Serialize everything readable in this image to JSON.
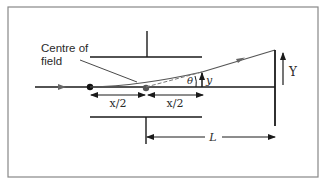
{
  "diagram": {
    "labels": {
      "centre_of_field_line1": "Centre of",
      "centre_of_field_line2": "field",
      "half_length_left": "x/2",
      "half_length_right": "x/2",
      "theta": "θ",
      "small_y": "y",
      "big_y": "Y",
      "distance_L": "L"
    },
    "elements": {
      "frame": "border",
      "top_plate": "deflection-plate",
      "bottom_plate": "deflection-plate",
      "screen": "screen",
      "beam_path": "curved-trajectory",
      "straight_extension": "dashed-extrapolation",
      "axis": "horizontal-axis"
    },
    "colors": {
      "line": "#2a2a2a",
      "beam": "#555555",
      "frame": "#888888",
      "dot_black": "#111111",
      "dot_grey": "#555555"
    }
  }
}
